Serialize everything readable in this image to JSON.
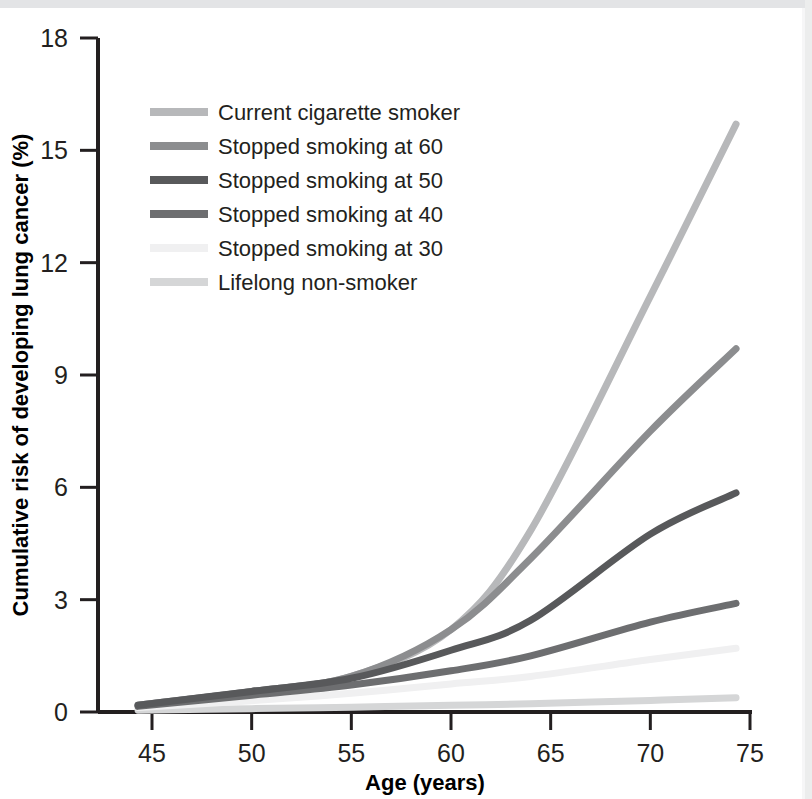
{
  "chart_data": {
    "type": "line",
    "title": "",
    "xlabel": "Age (years)",
    "ylabel": "Cumulative risk of developing lung cancer (%)",
    "xlim": [
      43.5,
      75
    ],
    "ylim": [
      0,
      18
    ],
    "xticks": [
      45,
      50,
      55,
      60,
      65,
      70,
      75
    ],
    "yticks": [
      0,
      3,
      6,
      9,
      12,
      15,
      18
    ],
    "grid": false,
    "legend_position": "upper-left-inside",
    "x": [
      44.3,
      50,
      55,
      60,
      64,
      70,
      74.3
    ],
    "series": [
      {
        "name": "Current cigarette smoker",
        "color": "#b7b8ba",
        "values": [
          0.18,
          0.55,
          0.95,
          2.2,
          4.85,
          11.1,
          15.7
        ]
      },
      {
        "name": "Stopped smoking at 60",
        "color": "#8c8d8f",
        "values": [
          0.18,
          0.55,
          0.95,
          2.2,
          4.1,
          7.5,
          9.7
        ]
      },
      {
        "name": "Stopped smoking at 50",
        "color": "#58595b",
        "values": [
          0.18,
          0.55,
          0.9,
          1.65,
          2.45,
          4.75,
          5.85
        ]
      },
      {
        "name": "Stopped smoking at 40",
        "color": "#6d6e70",
        "values": [
          0.15,
          0.45,
          0.72,
          1.1,
          1.5,
          2.4,
          2.9
        ]
      },
      {
        "name": "Stopped smoking at 30",
        "color": "#f0f0f1",
        "values": [
          0.12,
          0.3,
          0.5,
          0.75,
          0.95,
          1.4,
          1.7
        ]
      },
      {
        "name": "Lifelong non-smoker",
        "color": "#d5d6d7",
        "values": [
          0.05,
          0.09,
          0.13,
          0.18,
          0.22,
          0.31,
          0.38
        ]
      }
    ],
    "legend": [
      {
        "label": "Current cigarette smoker",
        "color": "#b7b8ba"
      },
      {
        "label": "Stopped smoking at 60",
        "color": "#8c8d8f"
      },
      {
        "label": "Stopped smoking at 50",
        "color": "#58595b"
      },
      {
        "label": "Stopped smoking at 40",
        "color": "#6d6e70"
      },
      {
        "label": "Stopped smoking at 30",
        "color": "#f0f0f1"
      },
      {
        "label": "Lifelong non-smoker",
        "color": "#d5d6d7"
      }
    ]
  },
  "axes": {
    "x_tick_labels": [
      "45",
      "50",
      "55",
      "60",
      "65",
      "70",
      "75"
    ],
    "y_tick_labels": [
      "0",
      "3",
      "6",
      "9",
      "12",
      "15",
      "18"
    ],
    "x_title": "Age (years)",
    "y_title": "Cumulative risk of developing lung cancer (%)"
  },
  "colors": {
    "axis": "#231f20",
    "background": "#ffffff",
    "top_band": "#e3e4e6"
  }
}
